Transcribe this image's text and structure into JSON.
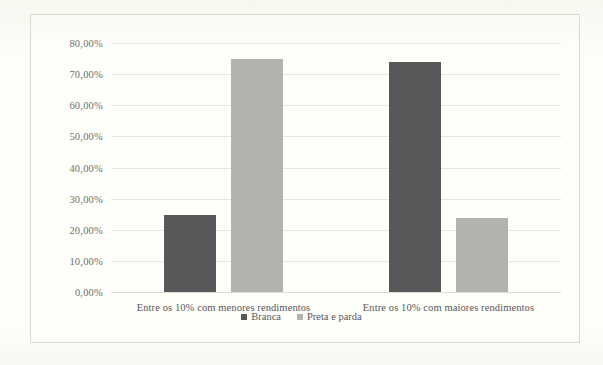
{
  "chart_data": {
    "type": "bar",
    "title": "",
    "subtitle": "",
    "xlabel": "",
    "ylabel": "",
    "categories": [
      "Entre os 10% com menores rendimentos",
      "Entre os 10% com maiores rendimentos"
    ],
    "series": [
      {
        "name": "Branca",
        "color": "#58585a",
        "values": [
          24.6,
          74.0
        ]
      },
      {
        "name": "Preta e parda",
        "color": "#b2b2ae",
        "values": [
          75.0,
          23.7
        ]
      }
    ],
    "ylim": [
      0,
      80
    ],
    "ytick_values": [
      0,
      10,
      20,
      30,
      40,
      50,
      60,
      70,
      80
    ],
    "ytick_labels": [
      "0,00%",
      "10,00%",
      "20,00%",
      "30,00%",
      "40,00%",
      "50,00%",
      "60,00%",
      "70,00%",
      "80,00%"
    ],
    "grid": true,
    "legend_position": "bottom",
    "value_suffix": "%",
    "decimal_separator": ","
  },
  "colors": {
    "series_branca": "#58585a",
    "series_preta_e_parda": "#b2b2ae",
    "gridline": "#e6e6dc",
    "plot_background": "#fefefb",
    "frame_border": "#d8d8d0",
    "tick_text": "#6f6f68",
    "label_text": "#58585a"
  }
}
